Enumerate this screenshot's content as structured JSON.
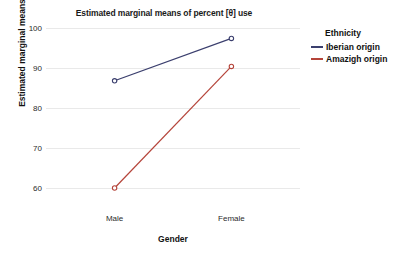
{
  "chart_data": {
    "type": "line",
    "title": "Estimated marginal means of percent [θ] use",
    "xlabel": "Gender",
    "ylabel": "Estimated marginal means",
    "categories": [
      "Male",
      "Female"
    ],
    "ylim": [
      55,
      100
    ],
    "yticks": [
      100,
      90,
      80,
      70,
      60
    ],
    "grid": true,
    "legend_position": "right",
    "legend_title": "Ethnicity",
    "series": [
      {
        "name": "Iberian origin",
        "color": "#3b3f6e",
        "values": [
          86.8,
          97.4
        ],
        "marker": "open-circle"
      },
      {
        "name": "Amazigh origin",
        "color": "#b5443a",
        "values": [
          60.0,
          90.4
        ],
        "marker": "open-circle"
      }
    ]
  },
  "axes": {
    "y_tick_labels": [
      "100",
      "90",
      "80",
      "70",
      "60"
    ],
    "x_tick_labels": [
      "Male",
      "Female"
    ]
  },
  "colors": {
    "background": "#ffffff",
    "gridline": "#e9e9e9",
    "text": "#111111",
    "series_1": "#3b3f6e",
    "series_2": "#b5443a"
  }
}
